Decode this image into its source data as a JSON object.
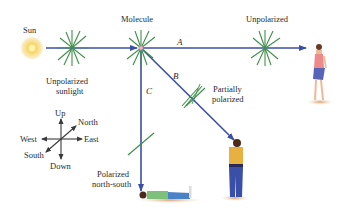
{
  "colors": {
    "ray": "#3a4fa8",
    "polarization_lines": "#3f8f4a",
    "sun_glow": "#f4cf5a",
    "compass": "#3a3a3a",
    "text": "#2a2a2a"
  },
  "labels": {
    "sun": "Sun",
    "molecule": "Molecule",
    "unpolarized_top": "Unpolarized",
    "unpolarized_sunlight_line1": "Unpolarized",
    "unpolarized_sunlight_line2": "sunlight",
    "ray_a": "A",
    "ray_b": "B",
    "ray_c": "C",
    "partially_line1": "Partially",
    "partially_line2": "polarized",
    "polarized_line1": "Polarized",
    "polarized_line2": "north-south"
  },
  "compass": {
    "up": "Up",
    "down": "Down",
    "north": "North",
    "south": "South",
    "east": "East",
    "west": "West"
  },
  "observers": [
    {
      "id": "A",
      "description": "standing woman, looking west toward molecule"
    },
    {
      "id": "B",
      "description": "standing man, looking up at molecule"
    },
    {
      "id": "C",
      "description": "person lying on ground, looking straight up"
    }
  ]
}
